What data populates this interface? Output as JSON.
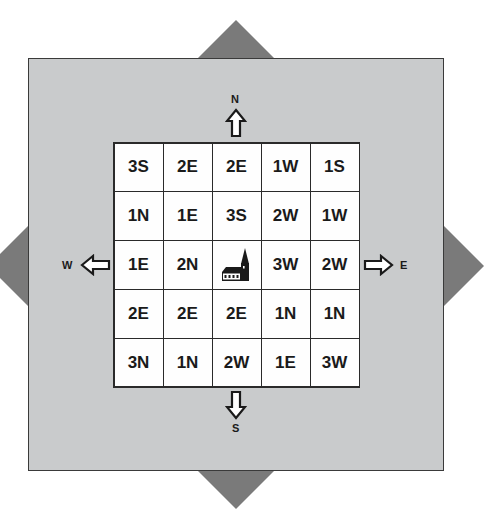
{
  "board": {
    "background_color": "#c9cbcc",
    "triangle_color": "#7a7a7a",
    "center_icon": "church-icon",
    "compass": {
      "north": "N",
      "south": "S",
      "west": "W",
      "east": "E"
    },
    "rows": [
      [
        "3S",
        "2E",
        "2E",
        "1W",
        "1S"
      ],
      [
        "1N",
        "1E",
        "3S",
        "2W",
        "1W"
      ],
      [
        "1E",
        "2N",
        "",
        "3W",
        "2W"
      ],
      [
        "2E",
        "2E",
        "2E",
        "1N",
        "1N"
      ],
      [
        "3N",
        "1N",
        "2W",
        "1E",
        "3W"
      ]
    ]
  }
}
